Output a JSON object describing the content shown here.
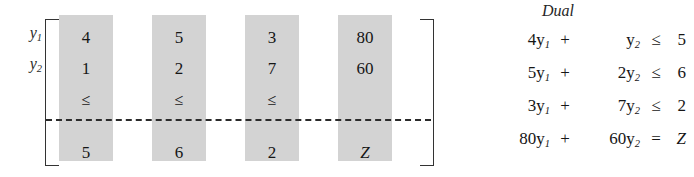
{
  "matrix": {
    "row_labels": [
      {
        "base": "y",
        "sub": "1"
      },
      {
        "base": "y",
        "sub": "2"
      }
    ],
    "columns": [
      {
        "c0": "4",
        "c1": "1",
        "c2": "≤",
        "c3": "5"
      },
      {
        "c0": "5",
        "c1": "2",
        "c2": "≤",
        "c3": "6"
      },
      {
        "c0": "3",
        "c1": "7",
        "c2": "≤",
        "c3": "2"
      },
      {
        "c0": "80",
        "c1": "60",
        "c2": "",
        "c3": "Z"
      }
    ]
  },
  "dual": {
    "title": "Dual",
    "equations": [
      {
        "term_a": "4y",
        "term_a_sub": "1",
        "op": "+",
        "term_b": "y",
        "term_b_sub": "2",
        "rel": "≤",
        "rhs": "5"
      },
      {
        "term_a": "5y",
        "term_a_sub": "1",
        "op": "+",
        "term_b": "2y",
        "term_b_sub": "2",
        "rel": "≤",
        "rhs": "6"
      },
      {
        "term_a": "3y",
        "term_a_sub": "1",
        "op": "+",
        "term_b": "7y",
        "term_b_sub": "2",
        "rel": "≤",
        "rhs": "2"
      },
      {
        "term_a": "80y",
        "term_a_sub": "1",
        "op": "+",
        "term_b": "60y",
        "term_b_sub": "2",
        "rel": "=",
        "rhs": "Z"
      }
    ]
  },
  "colors": {
    "column_shade": "#d3d3d3",
    "ink": "#161616",
    "bracket": "#333333"
  }
}
